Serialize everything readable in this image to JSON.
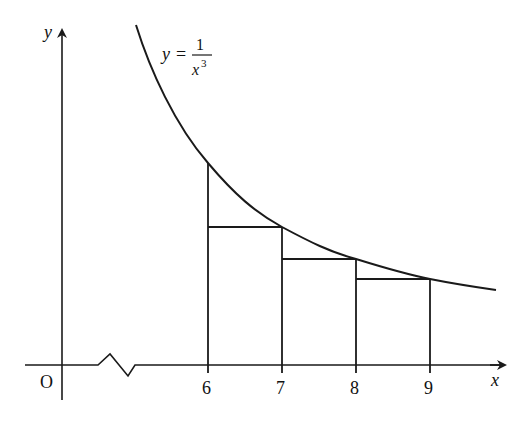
{
  "figure": {
    "curve_equation": {
      "lhs": "y",
      "equals": "=",
      "numerator": "1",
      "denominator_base": "x",
      "denominator_exp": "3"
    },
    "axes": {
      "x_label": "x",
      "y_label": "y",
      "origin_label": "O",
      "x_axis_break": true
    },
    "ticks": [
      {
        "value": 6,
        "label": "6"
      },
      {
        "value": 7,
        "label": "7"
      },
      {
        "value": 8,
        "label": "8"
      },
      {
        "value": 9,
        "label": "9"
      }
    ],
    "rectangles": [
      {
        "from": 6,
        "to": 7,
        "height_at": 7
      },
      {
        "from": 7,
        "to": 8,
        "height_at": 8
      },
      {
        "from": 8,
        "to": 9,
        "height_at": 9
      }
    ],
    "line_color": "#1a1a1a",
    "background": "#ffffff"
  }
}
